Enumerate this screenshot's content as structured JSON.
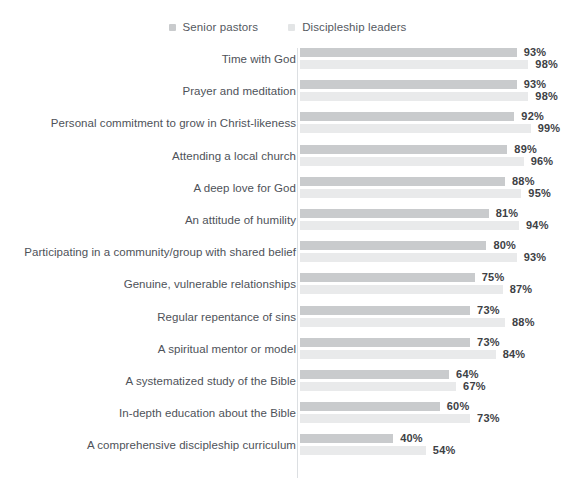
{
  "legend": {
    "items": [
      {
        "label": "Senior pastors",
        "color": "#c9cbcd",
        "swatch": "square-marker"
      },
      {
        "label": "Discipleship leaders",
        "color": "#e9eaeb",
        "swatch": "square-marker"
      }
    ]
  },
  "chart_data": {
    "type": "bar",
    "orientation": "horizontal",
    "grouped": true,
    "title": "",
    "subtitle": "",
    "xlabel": "",
    "ylabel": "",
    "xlim": [
      0,
      100
    ],
    "grid": false,
    "legend_position": "top-center",
    "value_suffix": "%",
    "categories": [
      "Time with God",
      "Prayer and meditation",
      "Personal commitment to grow in Christ-likeness",
      "Attending a local church",
      "A deep love for God",
      "An attitude of humility",
      "Participating in a community/group with shared belief",
      "Genuine, vulnerable relationships",
      "Regular repentance of sins",
      "A spiritual mentor or model",
      "A systematized study of the Bible",
      "In-depth education about the Bible",
      "A comprehensive discipleship curriculum"
    ],
    "series": [
      {
        "name": "Senior pastors",
        "color": "#c9cbcd",
        "values": [
          93,
          93,
          92,
          89,
          88,
          81,
          80,
          75,
          73,
          73,
          64,
          60,
          40
        ],
        "labels": [
          "93%",
          "93%",
          "92%",
          "89%",
          "88%",
          "81%",
          "80%",
          "75%",
          "73%",
          "73%",
          "64%",
          "60%",
          "40%"
        ]
      },
      {
        "name": "Discipleship leaders",
        "color": "#e9eaeb",
        "values": [
          98,
          98,
          99,
          96,
          95,
          94,
          93,
          87,
          88,
          84,
          67,
          73,
          54
        ],
        "labels": [
          "98%",
          "98%",
          "99%",
          "96%",
          "95%",
          "94%",
          "93%",
          "87%",
          "88%",
          "84%",
          "67%",
          "73%",
          "54%"
        ]
      }
    ]
  }
}
